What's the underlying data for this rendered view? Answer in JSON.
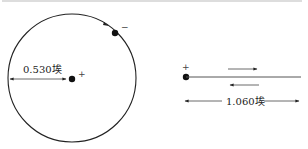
{
  "top_text_cut": "",
  "bohr_atom": {
    "radius_label": "0.530埃",
    "nucleus_sign": "+",
    "electron_sign": "−"
  },
  "molecule_ion": {
    "nucleus_sign": "+",
    "distance_label": "1.060埃"
  },
  "colors": {
    "line": "#222222",
    "line_light": "#555555",
    "background": "#ffffff"
  }
}
